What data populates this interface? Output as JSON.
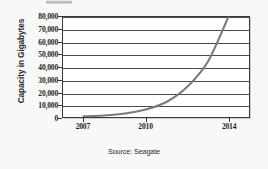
{
  "chart_data": {
    "type": "line",
    "title": "",
    "subtitle": "",
    "xlabel": "",
    "ylabel": "Capacity in Gigabytes",
    "source_note": "Source: Seagate",
    "x": [
      2007,
      2008,
      2009,
      2010,
      2011,
      2012,
      2013,
      2014
    ],
    "series": [
      {
        "name": "Hard drive capacity",
        "values": [
          500,
          1200,
          2800,
          6000,
          12000,
          24000,
          44000,
          80000
        ],
        "color": "#7a7a7a"
      }
    ],
    "xlim": [
      2006,
      2015
    ],
    "ylim": [
      0,
      80000
    ],
    "xticks": [
      2007,
      2010,
      2014
    ],
    "xtick_labels": [
      "2007",
      "2010",
      "2014"
    ],
    "yticks": [
      0,
      10000,
      20000,
      30000,
      40000,
      50000,
      60000,
      70000,
      80000
    ],
    "ytick_labels": [
      "0",
      "10,000",
      "20,000",
      "30,000",
      "40,000",
      "50,000",
      "60,000",
      "70,000",
      "80,000"
    ],
    "grid": "horizontal",
    "legend": "none",
    "plot_background": "#ffffff",
    "figure_background": "#f8f8f7",
    "axis_color": "#3a3a3a"
  }
}
